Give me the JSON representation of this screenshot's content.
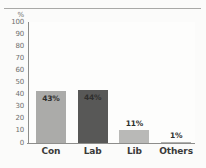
{
  "chart_data": {
    "type": "bar",
    "title": "",
    "xlabel": "",
    "ylabel": "%",
    "categories": [
      "Con",
      "Lab",
      "Lib",
      "Others"
    ],
    "values": [
      43,
      44,
      11,
      1
    ],
    "data_labels": [
      "43%",
      "44%",
      "11%",
      "1%"
    ],
    "ylim": [
      0,
      100
    ],
    "y_ticks": [
      "100",
      "90",
      "80",
      "70",
      "60",
      "50",
      "40",
      "30",
      "20",
      "10",
      "0"
    ],
    "y_tick_values": [
      100,
      90,
      80,
      70,
      60,
      50,
      40,
      30,
      20,
      10,
      0
    ],
    "grid": false,
    "legend": "none",
    "series": [
      {
        "name": "Vote share",
        "values": [
          43,
          44,
          11,
          1
        ]
      }
    ],
    "bar_colors": [
      "#ababa9",
      "#585857",
      "#b9b9b7",
      "#b0b0ae"
    ],
    "label_position": [
      "inside",
      "inside",
      "above",
      "above"
    ]
  },
  "colors": {
    "background": "#fbfbfa",
    "plot_background": "#fdfdfc",
    "axis": "#8d8d8b",
    "tick_text": "#6e6e6c",
    "category_text": "#3a3a39",
    "data_label_text": "#2f2f2e",
    "rule": "#9a9a98"
  }
}
